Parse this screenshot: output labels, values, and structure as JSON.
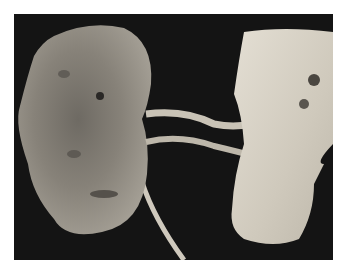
{
  "image": {
    "alt": "Gross specimen photograph: kidney with renal vessels attached to a segment of aorta on a black background",
    "background_color": "#141414",
    "border_color": "#ffffff",
    "subjects": [
      {
        "name": "kidney",
        "position": "left",
        "color": "#8a857c"
      },
      {
        "name": "renal-vessels",
        "position": "center",
        "color": "#c9c3b6"
      },
      {
        "name": "aorta-segment",
        "position": "right",
        "color": "#d8d2c6"
      },
      {
        "name": "ureter",
        "position": "bottom-center",
        "color": "#cfc9bd"
      }
    ]
  }
}
